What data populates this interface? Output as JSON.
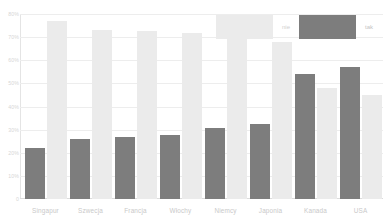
{
  "chart_data": {
    "type": "bar",
    "title": "",
    "subtitle": "",
    "xlabel": "",
    "ylabel": "",
    "ylim": [
      0,
      80
    ],
    "grid": true,
    "legend_position": "top-right-inside",
    "ytick_labels": [
      "80%",
      "70%",
      "60%",
      "50%",
      "40%",
      "30%",
      "20%",
      "10%",
      "0"
    ],
    "ytick_values": [
      80,
      70,
      60,
      50,
      40,
      30,
      20,
      10,
      0
    ],
    "categories": [
      "Singapur",
      "Szwecja",
      "Francja",
      "Włochy",
      "Niemcy",
      "Japonia",
      "Kanada",
      "USA"
    ],
    "series": [
      {
        "name": "tak",
        "color": "#7d7d7d",
        "values": [
          22,
          26,
          27,
          27.5,
          30.5,
          32.5,
          54,
          57
        ]
      },
      {
        "name": "nie",
        "color": "#ebebeb",
        "values": [
          77,
          73,
          72.5,
          72,
          77,
          68,
          48,
          45
        ]
      }
    ]
  },
  "legend": {
    "entries": [
      {
        "label": "nie",
        "swatch": "light-gray-swatch"
      },
      {
        "label": "tak",
        "swatch": "dark-gray-swatch"
      }
    ]
  },
  "colors": {
    "series_tak": "#7d7d7d",
    "series_nie": "#ebebeb",
    "gridline": "#ededed",
    "axis": "#dcdcdc",
    "tick_text": "#c9c9c9",
    "background": "#ffffff"
  }
}
